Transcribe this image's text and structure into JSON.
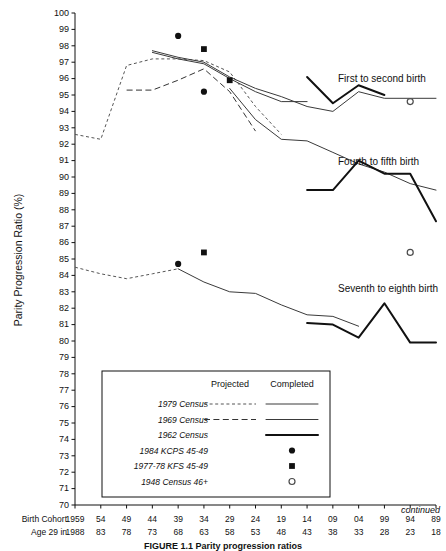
{
  "figure": {
    "caption": "FIGURE 1.1  Parity progression ratios",
    "continued_note": "continued"
  },
  "axes": {
    "y_title": "Parity Progression Ratio (%)",
    "y_ticks": [
      100,
      99,
      98,
      97,
      96,
      95,
      94,
      93,
      92,
      91,
      90,
      89,
      88,
      87,
      86,
      85,
      84,
      83,
      82,
      81,
      80,
      79,
      78,
      77,
      76,
      75,
      74,
      73,
      72,
      71,
      70
    ],
    "y_min": 70,
    "y_max": 100,
    "x_row1_label": "Birth Cohort",
    "x_row2_label": "Age 29 in",
    "x_row1_values": [
      "1959",
      "54",
      "49",
      "44",
      "39",
      "34",
      "29",
      "24",
      "19",
      "14",
      "09",
      "04",
      "99",
      "94",
      "89"
    ],
    "x_row2_values": [
      "1988",
      "83",
      "78",
      "73",
      "68",
      "63",
      "58",
      "53",
      "48",
      "43",
      "38",
      "33",
      "28",
      "23",
      "18"
    ]
  },
  "series_labels": [
    {
      "text": "First to second birth"
    },
    {
      "text": "Fourth to fifth birth"
    },
    {
      "text": "Seventh to eighth birth"
    }
  ],
  "legend": {
    "col_projected": "Projected",
    "col_completed": "Completed",
    "rows": [
      {
        "label": "1979 Census",
        "projected": "dashed-short",
        "completed": "line-thin"
      },
      {
        "label": "1969 Census",
        "projected": "dashed-long",
        "completed": "line-thin"
      },
      {
        "label": "1962 Census",
        "projected": "",
        "completed": "line-thick"
      },
      {
        "label": "1984 KCPS 45-49",
        "projected": "",
        "completed": "marker-dot"
      },
      {
        "label": "1977-78 KFS 45-49",
        "projected": "",
        "completed": "marker-square"
      },
      {
        "label": "1948 Census 46+",
        "projected": "",
        "completed": "marker-open"
      }
    ]
  },
  "chart_data": {
    "type": "line",
    "title": "Parity progression ratios",
    "xlabel": "Birth Cohort / Age 29 in",
    "ylabel": "Parity Progression Ratio (%)",
    "ylim": [
      70,
      100
    ],
    "xlim": [
      1959,
      1889
    ],
    "grid": false,
    "legend_position": "inset-bottom-left",
    "x_cohorts": [
      1959,
      1954,
      1949,
      1944,
      1939,
      1934,
      1929,
      1924,
      1919,
      1914,
      1909,
      1904,
      1899,
      1894,
      1889
    ],
    "panels": [
      {
        "name": "First to second birth",
        "series": [
          {
            "name": "1979 Census projected",
            "style": "dashed-short",
            "x": [
              1959,
              1954,
              1949,
              1944,
              1939,
              1934,
              1929,
              1924,
              1919
            ],
            "y": [
              92.6,
              92.3,
              96.8,
              97.2,
              97.2,
              97.1,
              96.4,
              94.3,
              92.6
            ]
          },
          {
            "name": "1969 Census projected",
            "style": "dashed-long",
            "x": [
              1949,
              1944,
              1939,
              1934,
              1929,
              1924
            ],
            "y": [
              95.3,
              95.3,
              95.9,
              96.6,
              95.2,
              92.8
            ]
          },
          {
            "name": "1979 Census completed",
            "style": "line-thin",
            "x": [
              1944,
              1939,
              1934,
              1929,
              1924,
              1919,
              1914,
              1909,
              1904,
              1899,
              1894,
              1889
            ],
            "y": [
              97.7,
              97.3,
              97.0,
              96.1,
              95.4,
              94.9,
              94.3,
              94.0,
              95.2,
              94.8,
              94.8,
              94.8
            ]
          },
          {
            "name": "1969 Census completed",
            "style": "line-thin",
            "x": [
              1944,
              1939,
              1934,
              1929,
              1924,
              1919,
              1914
            ],
            "y": [
              97.6,
              97.2,
              96.9,
              96.0,
              95.2,
              94.6,
              94.6
            ]
          },
          {
            "name": "1962 Census completed",
            "style": "line-thick",
            "x": [
              1914,
              1909,
              1904,
              1899
            ],
            "y": [
              96.1,
              94.5,
              95.6,
              95.0
            ]
          },
          {
            "name": "1984 KCPS 45-49",
            "style": "marker-dot",
            "x": [
              1939,
              1934
            ],
            "y": [
              98.6,
              95.2
            ]
          },
          {
            "name": "1977-78 KFS 45-49",
            "style": "marker-square",
            "x": [
              1934,
              1929
            ],
            "y": [
              97.8,
              95.9
            ]
          },
          {
            "name": "1948 Census 46+",
            "style": "marker-open",
            "x": [
              1894
            ],
            "y": [
              94.6
            ]
          }
        ]
      },
      {
        "name": "Fourth to fifth birth",
        "series": [
          {
            "name": "projected / completed composite",
            "style": "line-thin",
            "x": [
              1929,
              1924,
              1919,
              1914,
              1909,
              1904,
              1899,
              1894,
              1889
            ],
            "y": [
              95.4,
              93.5,
              92.3,
              92.2,
              91.5,
              90.8,
              90.3,
              89.6,
              89.2
            ]
          },
          {
            "name": "1962 Census completed",
            "style": "line-thick",
            "x": [
              1914,
              1909,
              1904,
              1899,
              1894,
              1889
            ],
            "y": [
              89.2,
              89.2,
              91.0,
              90.2,
              90.2,
              87.3
            ]
          }
        ]
      },
      {
        "name": "Seventh to eighth birth",
        "series": [
          {
            "name": "1979 Census projected",
            "style": "dashed-short",
            "x": [
              1959,
              1954,
              1949,
              1944,
              1939
            ],
            "y": [
              84.5,
              84.1,
              83.8,
              84.1,
              84.4
            ]
          },
          {
            "name": "completed",
            "style": "line-thin",
            "x": [
              1939,
              1934,
              1929,
              1924,
              1919,
              1914,
              1909,
              1904
            ],
            "y": [
              84.4,
              83.6,
              83.0,
              82.9,
              82.2,
              81.6,
              81.5,
              80.9
            ]
          },
          {
            "name": "1962 Census completed",
            "style": "line-thick",
            "x": [
              1914,
              1909,
              1904,
              1899,
              1894,
              1889
            ],
            "y": [
              81.1,
              81.0,
              80.2,
              82.3,
              79.9,
              79.9
            ]
          },
          {
            "name": "1984 KCPS 45-49",
            "style": "marker-dot",
            "x": [
              1939
            ],
            "y": [
              84.7
            ]
          },
          {
            "name": "1977-78 KFS 45-49",
            "style": "marker-square",
            "x": [
              1934
            ],
            "y": [
              85.4
            ]
          },
          {
            "name": "1948 Census 46+",
            "style": "marker-open",
            "x": [
              1894
            ],
            "y": [
              85.4
            ]
          }
        ]
      }
    ]
  }
}
